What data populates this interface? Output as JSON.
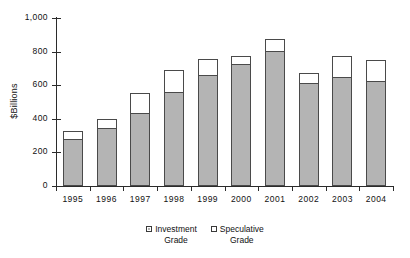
{
  "chart_data": {
    "type": "bar",
    "subtype": "stacked",
    "title": "",
    "xlabel": "",
    "ylabel": "$Billions",
    "ylim": [
      0,
      1000
    ],
    "ytick_values": [
      0,
      200,
      400,
      600,
      800,
      1000
    ],
    "ytick_labels": [
      "0",
      "200",
      "400",
      "600",
      "800",
      "1,000"
    ],
    "grid": false,
    "legend_position": "bottom",
    "categories": [
      "1995",
      "1996",
      "1997",
      "1998",
      "1999",
      "2000",
      "2001",
      "2002",
      "2003",
      "2004"
    ],
    "series": [
      {
        "name": "Investment Grade",
        "color": "#b4b4b4",
        "values": [
          280,
          345,
          434,
          560,
          661,
          726,
          803,
          613,
          649,
          625
        ]
      },
      {
        "name": "Speculative Grade",
        "color": "#ffffff",
        "values": [
          47,
          54,
          120,
          130,
          95,
          48,
          72,
          60,
          125,
          125
        ]
      }
    ],
    "totals": [
      327,
      399,
      554,
      690,
      756,
      774,
      875,
      673,
      774,
      750
    ]
  },
  "legend": {
    "items": [
      {
        "label": "Investment\nGrade",
        "swatch": "filled-gray-swatch"
      },
      {
        "label": "Speculative\nGrade",
        "swatch": "empty-white-swatch"
      }
    ]
  },
  "colors": {
    "investment_grade": "#b4b4b4",
    "speculative_grade": "#ffffff",
    "bar_outline": "#4a4a4a",
    "axis": "#2b2b2b",
    "text": "#111111",
    "background": "#ffffff"
  }
}
